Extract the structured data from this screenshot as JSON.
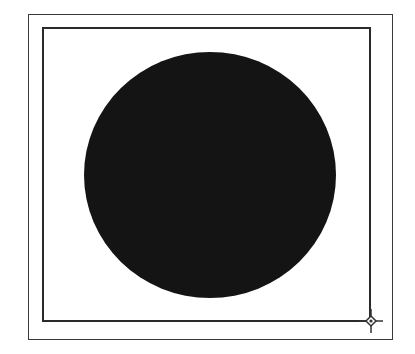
{
  "canvas": {
    "width": 415,
    "height": 354,
    "background": "#ffffff"
  },
  "outer_frame": {
    "color": "#3a3a3a"
  },
  "inner_frame": {
    "color": "#2a2a2a"
  },
  "shape": {
    "type": "circle",
    "fill": "#141414"
  },
  "resize_handle": {
    "icon": "diamond-crosshair-icon",
    "color": "#333333"
  }
}
